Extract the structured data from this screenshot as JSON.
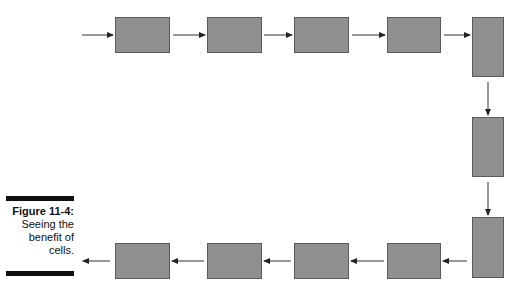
{
  "figure": {
    "label": "Figure 11-4:",
    "caption_lines": [
      "Seeing the",
      "benefit of",
      "cells."
    ]
  },
  "diagram": {
    "box_color": "#8f8f8f",
    "box_border": "#5a5a5a",
    "box_count": 11,
    "flow": "top row left-to-right, down the right column, bottom row right-to-left"
  }
}
